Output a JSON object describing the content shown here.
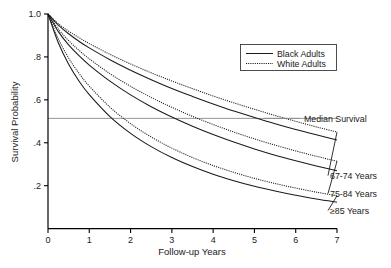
{
  "chart_data": {
    "type": "line",
    "title": "",
    "xlabel": "Follow-up Years",
    "ylabel": "Survival Probability",
    "xlim": [
      0,
      7
    ],
    "ylim": [
      0,
      1.0
    ],
    "xticks": [
      "0",
      "1",
      "2",
      "3",
      "4",
      "5",
      "6",
      "7"
    ],
    "yticks": [
      "1.0",
      ".8",
      ".6",
      ".4",
      ".2"
    ],
    "ytick_values": [
      1.0,
      0.8,
      0.6,
      0.4,
      0.2
    ],
    "grid": false,
    "legend_position": "top-right",
    "legend": [
      {
        "label": "Black Adults",
        "style": "solid"
      },
      {
        "label": "White Adults",
        "style": "dotted"
      }
    ],
    "annotations": [
      {
        "text": "Median Survival",
        "y": 0.5,
        "type": "reference-line-label"
      },
      {
        "text": "67-74 Years",
        "type": "group-label"
      },
      {
        "text": "75-84 Years",
        "type": "group-label"
      },
      {
        "text": "≥85 Years",
        "type": "group-label"
      }
    ],
    "reference_lines": [
      {
        "label": "Median Survival",
        "orientation": "horizontal",
        "value": 0.5
      }
    ],
    "x": [
      0,
      0.25,
      0.5,
      0.75,
      1,
      1.5,
      2,
      2.5,
      3,
      3.5,
      4,
      4.5,
      5,
      5.5,
      6,
      6.5,
      7
    ],
    "series": [
      {
        "name": "67-74 Years, White Adults",
        "group": "67-74 Years",
        "race": "White Adults",
        "style": "dotted",
        "values": [
          1.0,
          0.955,
          0.92,
          0.89,
          0.862,
          0.812,
          0.767,
          0.726,
          0.688,
          0.652,
          0.618,
          0.586,
          0.556,
          0.527,
          0.5,
          0.474,
          0.45
        ]
      },
      {
        "name": "67-74 Years, Black Adults",
        "group": "67-74 Years",
        "race": "Black Adults",
        "style": "solid",
        "values": [
          1.0,
          0.948,
          0.908,
          0.873,
          0.842,
          0.787,
          0.738,
          0.694,
          0.653,
          0.616,
          0.581,
          0.548,
          0.518,
          0.489,
          0.462,
          0.437,
          0.413
        ]
      },
      {
        "name": "75-84 Years, White Adults",
        "group": "75-84 Years",
        "race": "White Adults",
        "style": "dotted",
        "values": [
          1.0,
          0.93,
          0.876,
          0.831,
          0.791,
          0.722,
          0.663,
          0.611,
          0.565,
          0.523,
          0.485,
          0.45,
          0.418,
          0.389,
          0.362,
          0.337,
          0.314
        ]
      },
      {
        "name": "75-84 Years, Black Adults",
        "group": "75-84 Years",
        "race": "Black Adults",
        "style": "solid",
        "values": [
          1.0,
          0.918,
          0.856,
          0.806,
          0.762,
          0.687,
          0.623,
          0.568,
          0.52,
          0.477,
          0.438,
          0.403,
          0.371,
          0.342,
          0.316,
          0.292,
          0.27
        ]
      },
      {
        "name": "≥85 Years, White Adults",
        "group": "≥85 Years",
        "race": "White Adults",
        "style": "dotted",
        "values": [
          1.0,
          0.884,
          0.795,
          0.724,
          0.664,
          0.566,
          0.489,
          0.427,
          0.375,
          0.331,
          0.294,
          0.262,
          0.234,
          0.21,
          0.189,
          0.17,
          0.153
        ]
      },
      {
        "name": "≥85 Years, Black Adults",
        "group": "≥85 Years",
        "race": "Black Adults",
        "style": "solid",
        "values": [
          1.0,
          0.866,
          0.766,
          0.688,
          0.624,
          0.522,
          0.444,
          0.382,
          0.331,
          0.289,
          0.253,
          0.223,
          0.197,
          0.175,
          0.155,
          0.138,
          0.123
        ]
      }
    ]
  },
  "axes": {
    "y_title": "Survival Probability",
    "x_title": "Follow-up Years",
    "xticks": [
      "0",
      "1",
      "2",
      "3",
      "4",
      "5",
      "6",
      "7"
    ],
    "yticks": [
      "1.0",
      ".8",
      ".6",
      ".4",
      ".2"
    ]
  },
  "legend": {
    "entries": [
      {
        "label": "Black Adults"
      },
      {
        "label": "White Adults"
      }
    ]
  },
  "annotations": {
    "median": "Median Survival",
    "group_67_74": "67-74 Years",
    "group_75_84": "75-84 Years",
    "group_85": "≥85 Years"
  },
  "colors": {
    "curve": "#1a1a1a",
    "median_line": "#8c8c8c",
    "axis": "#000000",
    "background": "#ffffff"
  }
}
